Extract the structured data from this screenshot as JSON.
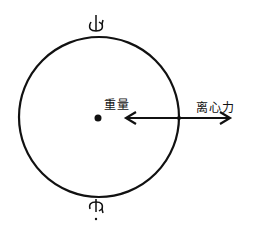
{
  "diagram": {
    "title": "",
    "colors": {
      "ink": "#111111",
      "background": "#ffffff"
    },
    "circle": {
      "cx": 99,
      "cy": 117,
      "r": 80,
      "stroke_width": 2.2
    },
    "center_dot": {
      "cx": 98,
      "cy": 118,
      "r": 3.5
    },
    "rotation_axis": {
      "top_symbol": "rotation-arrow-icon",
      "bottom_symbol": "rotation-arrow-icon"
    },
    "double_arrow": {
      "x1": 126,
      "x2": 230,
      "y": 118
    },
    "labels": {
      "gravity": "重量",
      "centrifugal_force": "离心力"
    }
  }
}
